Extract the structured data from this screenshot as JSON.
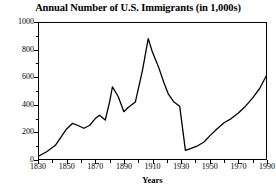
{
  "chart_data": {
    "type": "line",
    "title": "Annual Number of U.S. Immigrants (in 1,000s)",
    "xlabel": "Years",
    "ylabel": "",
    "xlim": [
      1830,
      1990
    ],
    "ylim": [
      0,
      1000
    ],
    "xticks": [
      1830,
      1850,
      1870,
      1890,
      1910,
      1930,
      1950,
      1970,
      1990
    ],
    "yticks": [
      0,
      200,
      400,
      600,
      800,
      1000
    ],
    "xtick_labels": [
      "1830",
      "1850",
      "1870",
      "1890",
      "1910",
      "1930",
      "1950",
      "1970",
      "1990"
    ],
    "ytick_labels": [
      "0",
      "200",
      "400",
      "600",
      "800",
      "1000"
    ],
    "x_minor_step": 10,
    "y_minor_step": 100,
    "grid": false,
    "legend": null,
    "line_color": "#000000",
    "x": [
      1830,
      1836,
      1842,
      1847,
      1850,
      1854,
      1858,
      1862,
      1866,
      1870,
      1873,
      1877,
      1880,
      1882,
      1886,
      1890,
      1893,
      1898,
      1903,
      1907,
      1910,
      1914,
      1918,
      1921,
      1925,
      1929,
      1933,
      1937,
      1941,
      1946,
      1950,
      1955,
      1960,
      1965,
      1970,
      1975,
      1980,
      1985,
      1990
    ],
    "values": [
      25,
      60,
      105,
      180,
      225,
      265,
      250,
      230,
      250,
      300,
      325,
      290,
      420,
      530,
      460,
      350,
      380,
      420,
      650,
      880,
      780,
      680,
      560,
      480,
      420,
      390,
      70,
      85,
      100,
      130,
      175,
      225,
      270,
      300,
      340,
      390,
      450,
      520,
      620
    ]
  }
}
